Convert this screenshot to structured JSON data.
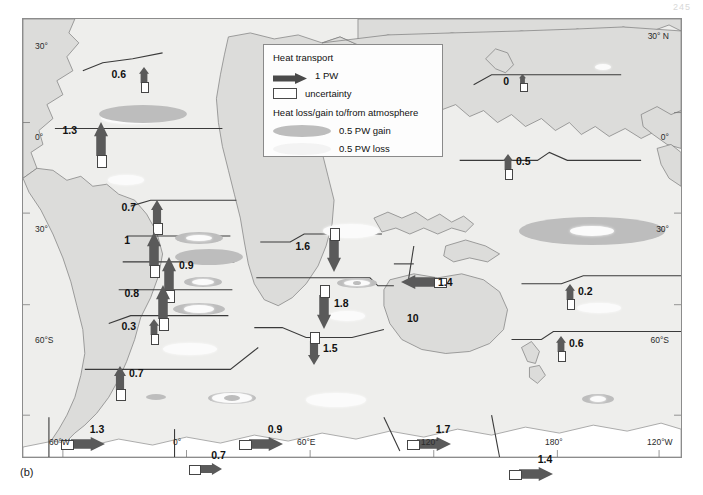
{
  "page_number": "245",
  "caption": "(b)",
  "legend": {
    "title": "Heat transport",
    "transport_scale_label": "1 PW",
    "uncertainty_label": "uncertainty",
    "title2": "Heat loss/gain to/from atmosphere",
    "gain_label": "0.5 PW gain",
    "loss_label": "0.5 PW loss"
  },
  "colors": {
    "ocean": "#eeeeec",
    "land": "#d8d8d6",
    "arrow": "#5a5a5a",
    "arrow_dark": "#4a4a4a",
    "gain": "#bdbdbd",
    "loss": "#fbfbfb",
    "frame": "#8c8c8c",
    "text": "#111111"
  },
  "axes": {
    "left": [
      {
        "label": "30°",
        "y": 122
      },
      {
        "label": "0°",
        "y": 213
      },
      {
        "label": "30°",
        "y": 305
      },
      {
        "label": "60°S",
        "y": 416
      }
    ],
    "right": [
      {
        "label": "30° N",
        "y": 112
      },
      {
        "label": "0°",
        "y": 213
      },
      {
        "label": "30°",
        "y": 305
      },
      {
        "label": "60°S",
        "y": 416
      }
    ],
    "bottom": [
      {
        "label": "60°W",
        "x": 62
      },
      {
        "label": "0°",
        "x": 186
      },
      {
        "label": "60°E",
        "x": 310
      },
      {
        "label": "120°",
        "x": 434
      },
      {
        "label": "180°",
        "x": 558
      },
      {
        "label": "120°W",
        "x": 660
      }
    ]
  },
  "annotations": [
    {
      "name": "indonesian-throughflow-latitude",
      "text": "10",
      "x": 384,
      "y": 293
    }
  ],
  "chart_data": {
    "type": "map",
    "units": "PW",
    "transports": [
      {
        "id": "natl-50n",
        "value": "0.6",
        "dir": "up",
        "x": 116,
        "y": 48,
        "size": "small",
        "label_side": "left"
      },
      {
        "id": "natl-24n",
        "value": "1.3",
        "dir": "up",
        "x": 71,
        "y": 103,
        "size": "large",
        "label_side": "left"
      },
      {
        "id": "natl-11n",
        "value": "0.7",
        "dir": "up",
        "x": 128,
        "y": 181,
        "size": "medium",
        "label_side": "left"
      },
      {
        "id": "natl-8n",
        "value": "1",
        "dir": "up",
        "x": 124,
        "y": 213,
        "size": "large",
        "label_side": "left"
      },
      {
        "id": "natl-eq",
        "value": "0.9",
        "dir": "up",
        "x": 139,
        "y": 238,
        "size": "large",
        "label_side": "right"
      },
      {
        "id": "satl-11s",
        "value": "0.8",
        "dir": "up",
        "x": 133,
        "y": 266,
        "size": "large",
        "label_side": "left"
      },
      {
        "id": "satl-30s",
        "value": "0.3",
        "dir": "up",
        "x": 126,
        "y": 300,
        "size": "small",
        "label_side": "left"
      },
      {
        "id": "satl-45s",
        "value": "0.7",
        "dir": "up",
        "x": 91,
        "y": 347,
        "size": "medium",
        "label_side": "right"
      },
      {
        "id": "satl-60s",
        "value": "1.3",
        "dir": "right",
        "x": 48,
        "y": 418,
        "size": "large",
        "label_side": "above"
      },
      {
        "id": "ind-0e",
        "value": "0.7",
        "dir": "right",
        "x": 175,
        "y": 444,
        "size": "medium",
        "label_side": "above"
      },
      {
        "id": "ind-20s",
        "value": "1.6",
        "dir": "down",
        "x": 304,
        "y": 219,
        "size": "large",
        "label_side": "left"
      },
      {
        "id": "ind-32s",
        "value": "1.8",
        "dir": "down",
        "x": 294,
        "y": 276,
        "size": "large",
        "label_side": "right"
      },
      {
        "id": "ind-45s",
        "value": "1.5",
        "dir": "down",
        "x": 285,
        "y": 322,
        "size": "medium",
        "label_side": "right"
      },
      {
        "id": "indo-flow",
        "value": "1.4",
        "dir": "left",
        "x": 378,
        "y": 256,
        "size": "large",
        "label_side": "right"
      },
      {
        "id": "so-60e",
        "value": "0.9",
        "dir": "right",
        "x": 226,
        "y": 418,
        "size": "large",
        "label_side": "above"
      },
      {
        "id": "npac-47n",
        "value": "0",
        "dir": "up",
        "x": 496,
        "y": 55,
        "size": "tiny",
        "label_side": "left"
      },
      {
        "id": "npac-24n",
        "value": "0.5",
        "dir": "up",
        "x": 480,
        "y": 135,
        "size": "small",
        "label_side": "right"
      },
      {
        "id": "spac-18s",
        "value": "0.2",
        "dir": "up",
        "x": 542,
        "y": 265,
        "size": "small",
        "label_side": "right"
      },
      {
        "id": "spac-32s",
        "value": "0.6",
        "dir": "up",
        "x": 533,
        "y": 317,
        "size": "small",
        "label_side": "right"
      },
      {
        "id": "so-150e",
        "value": "1.7",
        "dir": "right",
        "x": 394,
        "y": 418,
        "size": "large",
        "label_side": "above"
      },
      {
        "id": "so-170w",
        "value": "1.4",
        "dir": "right",
        "x": 496,
        "y": 448,
        "size": "large",
        "label_side": "above"
      }
    ],
    "flux_ellipses": [
      {
        "type": "loss",
        "x": 110,
        "y": 99,
        "rx": 32,
        "ry": 6
      },
      {
        "type": "gain",
        "x": 120,
        "y": 95,
        "rx": 44,
        "ry": 9
      },
      {
        "type": "loss",
        "x": 103,
        "y": 161,
        "rx": 18,
        "ry": 5
      },
      {
        "type": "gain",
        "x": 176,
        "y": 219,
        "rx": 24,
        "ry": 6
      },
      {
        "type": "loss",
        "x": 176,
        "y": 219,
        "rx": 13,
        "ry": 3
      },
      {
        "type": "loss",
        "x": 186,
        "y": 238,
        "rx": 27,
        "ry": 6
      },
      {
        "type": "gain",
        "x": 186,
        "y": 238,
        "rx": 34,
        "ry": 8
      },
      {
        "type": "gain",
        "x": 180,
        "y": 263,
        "rx": 19,
        "ry": 5
      },
      {
        "type": "loss",
        "x": 180,
        "y": 263,
        "rx": 11,
        "ry": 3
      },
      {
        "type": "gain",
        "x": 176,
        "y": 290,
        "rx": 26,
        "ry": 6
      },
      {
        "type": "loss",
        "x": 176,
        "y": 290,
        "rx": 15,
        "ry": 4
      },
      {
        "type": "loss",
        "x": 167,
        "y": 330,
        "rx": 27,
        "ry": 6
      },
      {
        "type": "gain",
        "x": 133,
        "y": 378,
        "rx": 10,
        "ry": 3
      },
      {
        "type": "gain",
        "x": 209,
        "y": 379,
        "rx": 24,
        "ry": 6
      },
      {
        "type": "loss",
        "x": 209,
        "y": 379,
        "rx": 20,
        "ry": 5
      },
      {
        "type": "gain",
        "x": 209,
        "y": 379,
        "rx": 8,
        "ry": 3
      },
      {
        "type": "loss",
        "x": 328,
        "y": 212,
        "rx": 28,
        "ry": 7
      },
      {
        "type": "gain",
        "x": 334,
        "y": 264,
        "rx": 20,
        "ry": 5
      },
      {
        "type": "loss",
        "x": 334,
        "y": 264,
        "rx": 13,
        "ry": 3
      },
      {
        "type": "gain",
        "x": 334,
        "y": 264,
        "rx": 4,
        "ry": 2
      },
      {
        "type": "loss",
        "x": 324,
        "y": 297,
        "rx": 18,
        "ry": 5
      },
      {
        "type": "loss",
        "x": 313,
        "y": 381,
        "rx": 30,
        "ry": 7
      },
      {
        "type": "loss",
        "x": 580,
        "y": 48,
        "rx": 8,
        "ry": 3
      },
      {
        "type": "gain",
        "x": 569,
        "y": 212,
        "rx": 73,
        "ry": 14
      },
      {
        "type": "loss",
        "x": 569,
        "y": 212,
        "rx": 22,
        "ry": 5
      },
      {
        "type": "loss",
        "x": 576,
        "y": 289,
        "rx": 22,
        "ry": 5
      },
      {
        "type": "gain",
        "x": 575,
        "y": 380,
        "rx": 16,
        "ry": 5
      },
      {
        "type": "loss",
        "x": 575,
        "y": 380,
        "rx": 8,
        "ry": 3
      }
    ]
  }
}
